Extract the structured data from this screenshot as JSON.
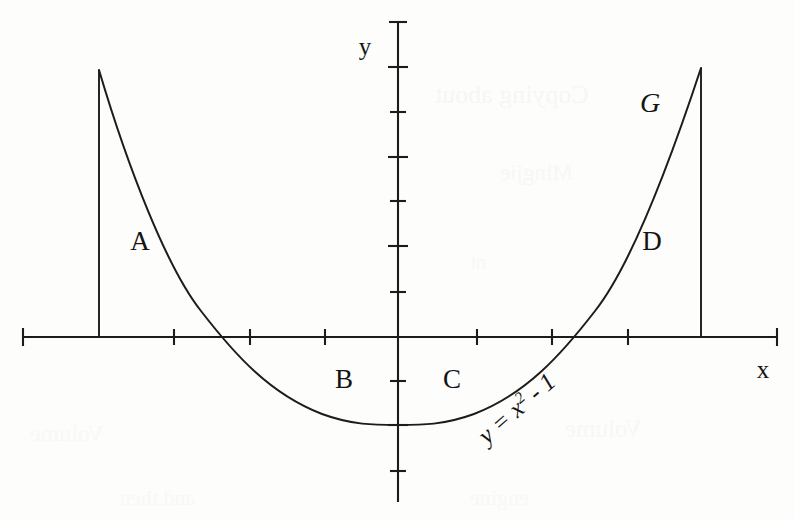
{
  "figure": {
    "caption_title": "",
    "axis_labels": {
      "x": "x",
      "y": "y"
    },
    "region_labels": [
      {
        "name": "A",
        "text": "A"
      },
      {
        "name": "B",
        "text": "B"
      },
      {
        "name": "C",
        "text": "C"
      },
      {
        "name": "D",
        "text": "D"
      }
    ],
    "curve_label": "G",
    "equation": {
      "lhs": "y",
      "eq": " = ",
      "base": "x",
      "exponent": "2",
      "rest": " - 1",
      "full": "y = x² - 1"
    }
  },
  "chart_data": {
    "type": "line",
    "title": "",
    "subtitle": "",
    "xlabel": "x",
    "ylabel": "y",
    "function": "y = x^2 - 1",
    "curve_name": "G",
    "grid": false,
    "legend": "none",
    "xlim": [
      -5.0,
      5.0
    ],
    "ylim": [
      -3.7,
      7.1
    ],
    "x_ticks": [
      -4,
      -3,
      -2,
      -1,
      0,
      1,
      2,
      3,
      4
    ],
    "y_ticks": [
      -3,
      -2,
      -1,
      0,
      1,
      2,
      3,
      4,
      5,
      6,
      7
    ],
    "x_tick_labels": [
      "",
      "",
      "",
      "",
      "",
      "",
      "",
      "",
      ""
    ],
    "y_tick_labels": [
      "",
      "",
      "",
      "",
      "",
      "",
      "",
      "",
      "",
      "",
      ""
    ],
    "domain_drawn": [
      -4.0,
      4.0
    ],
    "roots": [
      -1,
      1
    ],
    "vertex": [
      0,
      -1
    ],
    "series": [
      {
        "name": "G",
        "expression": "y = x^2 - 1",
        "x": [
          -4.0,
          -3.5,
          -3.0,
          -2.5,
          -2.0,
          -1.5,
          -1.0,
          -0.5,
          0.0,
          0.5,
          1.0,
          1.5,
          2.0,
          2.5,
          3.0,
          3.5,
          4.0
        ],
        "y": [
          15.0,
          11.25,
          8.0,
          5.25,
          3.0,
          1.25,
          0.0,
          -0.75,
          -1.0,
          -0.75,
          0.0,
          1.25,
          3.0,
          5.25,
          8.0,
          11.25,
          15.0
        ]
      }
    ],
    "vertical_boundaries": [
      {
        "name": "left-boundary",
        "x": -4.0,
        "y_from": 0,
        "y_to": 7.0
      },
      {
        "name": "right-boundary",
        "x": 4.0,
        "y_from": 0,
        "y_to": 7.0
      }
    ],
    "annotations": [
      {
        "label": "A",
        "x": -3.2,
        "y": 2.2,
        "note": "region between left boundary and curve above axis"
      },
      {
        "label": "B",
        "x": -0.75,
        "y": -0.95,
        "note": "region under axis left of y-axis"
      },
      {
        "label": "C",
        "x": 0.7,
        "y": -0.95,
        "note": "region under axis right of y-axis"
      },
      {
        "label": "D",
        "x": 3.3,
        "y": 2.2,
        "note": "region between curve and right boundary above axis"
      },
      {
        "label": "G",
        "x": 3.3,
        "y": 5.3,
        "note": "curve name"
      },
      {
        "label": "y = x² - 1",
        "x": 1.8,
        "y": -1.4,
        "note": "equation of the curve, rotated along the curve"
      }
    ]
  },
  "ghost_text": [
    {
      "text": "Copying about",
      "x": 435,
      "y": 80,
      "size": 26,
      "opacity": 0.3
    },
    {
      "text": "Mingjie",
      "x": 500,
      "y": 160,
      "size": 23,
      "opacity": 0.26
    },
    {
      "text": "nt",
      "x": 470,
      "y": 250,
      "size": 21,
      "opacity": 0.22
    },
    {
      "text": "Volume",
      "x": 565,
      "y": 415,
      "size": 25,
      "opacity": 0.24
    },
    {
      "text": "and then",
      "x": 120,
      "y": 485,
      "size": 22,
      "opacity": 0.22
    },
    {
      "text": "engine",
      "x": 470,
      "y": 485,
      "size": 22,
      "opacity": 0.22
    },
    {
      "text": "Volume",
      "x": 30,
      "y": 420,
      "size": 24,
      "opacity": 0.2
    }
  ]
}
